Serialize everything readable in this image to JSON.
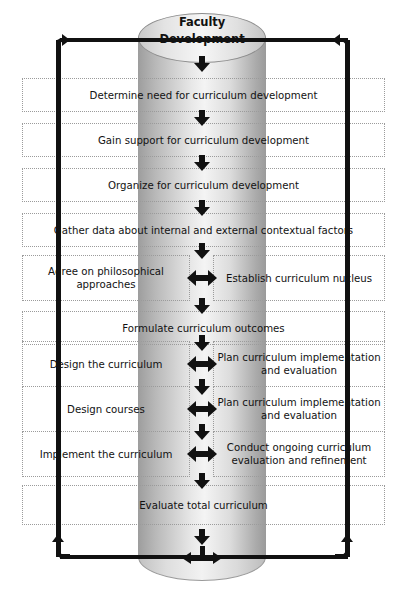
{
  "diagram": {
    "title_line1": "Faculty",
    "title_line2": "Development",
    "cylinder_name": "faculty-development-cylinder",
    "colors": {
      "line": "#111111",
      "box_border": "#9b9b9b",
      "cylinder_light": "#f4f4f4",
      "cylinder_dark": "#9a9a9a",
      "text": "#121212"
    },
    "steps": [
      {
        "type": "full",
        "text": "Determine need for curriculum development"
      },
      {
        "type": "full",
        "text": "Gain support for curriculum development"
      },
      {
        "type": "full",
        "text": "Organize for curriculum development"
      },
      {
        "type": "full",
        "text": "Gather data about internal and external contextual factors"
      },
      {
        "type": "split",
        "left": "Agree on philosophical approaches",
        "right": "Establish curriculum nucleus"
      },
      {
        "type": "full",
        "text": "Formulate curriculum outcomes"
      },
      {
        "type": "split",
        "left": "Design the curriculum",
        "right": "Plan curriculum implementation and evaluation"
      },
      {
        "type": "split",
        "left": "Design courses",
        "right": "Plan curriculum implementation and evaluation"
      },
      {
        "type": "split",
        "left": "Implement the curriculum",
        "right": "Conduct ongoing curriculum evaluation and refinement"
      },
      {
        "type": "full",
        "text": "Evaluate total curriculum"
      }
    ]
  }
}
